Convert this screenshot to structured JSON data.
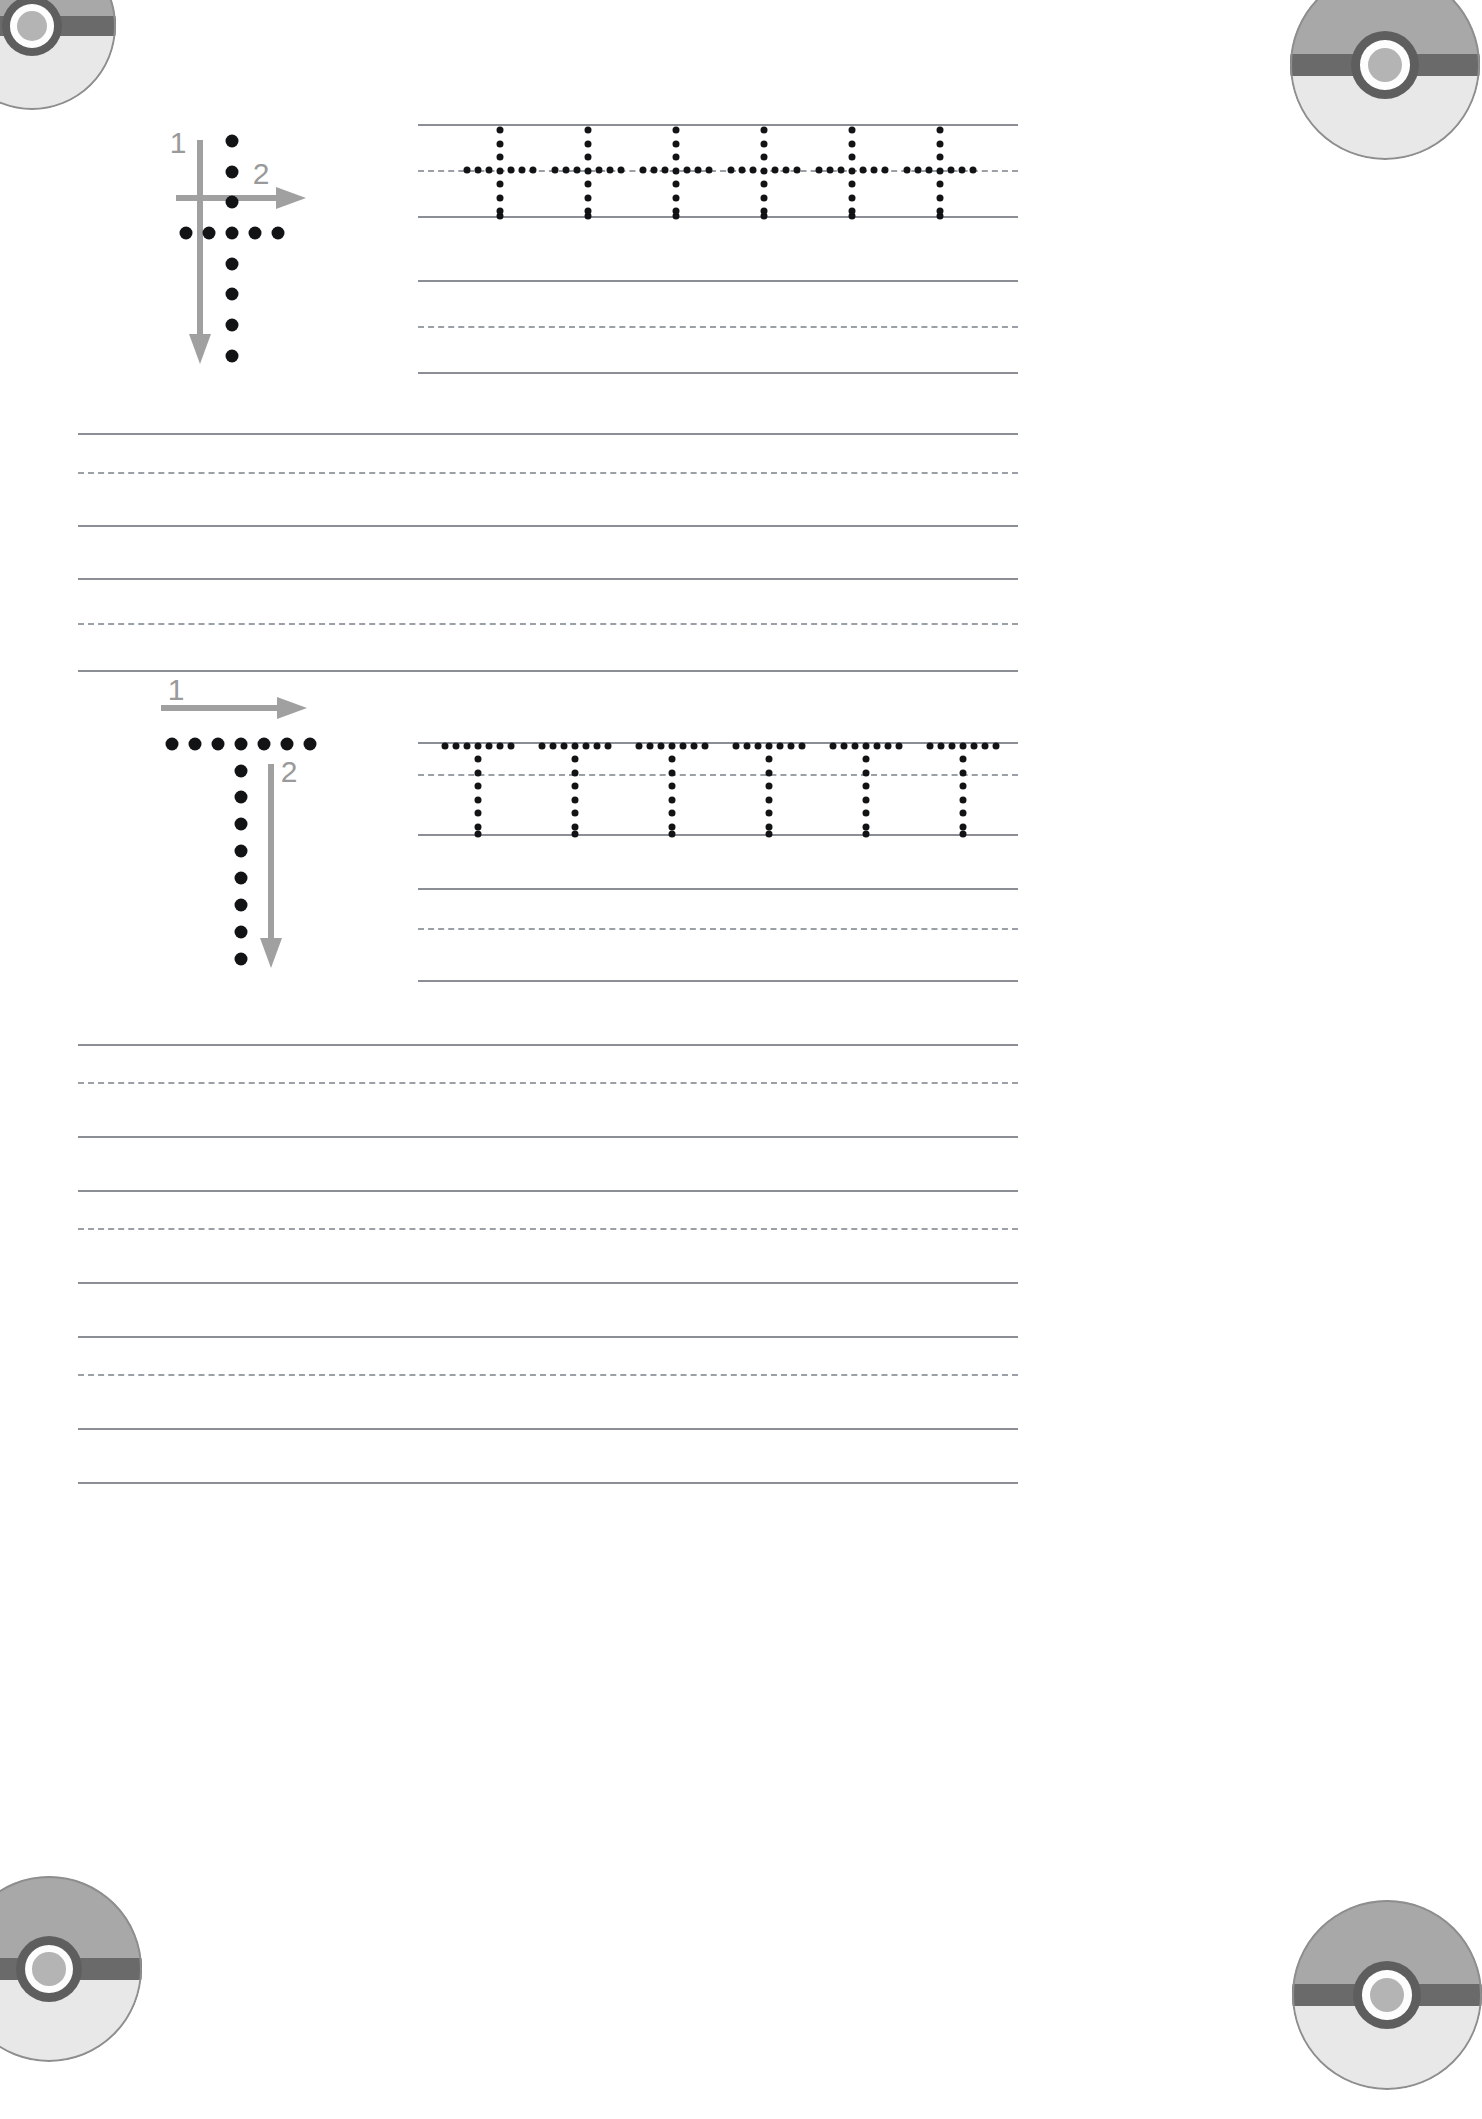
{
  "worksheet": {
    "letter_lowercase": "t",
    "letter_uppercase": "T",
    "page_width": 1482,
    "page_height": 2119,
    "colors": {
      "solid_line": "#8b8f95",
      "dashed_line": "#9aa0a6",
      "trace_dot": "#111315",
      "arrow": "#a0a0a0",
      "stroke_number": "#9a9a9a",
      "pokeball_top": "#a8a8a8",
      "pokeball_bottom": "#e8e8e8",
      "pokeball_band": "#6a6a6a",
      "pokeball_button": "#b4b4b4"
    }
  },
  "decorations": {
    "pokeballs": [
      {
        "name": "pokeball-top-left",
        "x": -52,
        "y": -58,
        "size": 168
      },
      {
        "name": "pokeball-top-right",
        "x": 1290,
        "y": -30,
        "size": 190
      },
      {
        "name": "pokeball-bottom-left",
        "x": -44,
        "y": 1876,
        "size": 186
      },
      {
        "name": "pokeball-bottom-right",
        "x": 1292,
        "y": 1900,
        "size": 190
      }
    ]
  },
  "sections": [
    {
      "id": "lowercase-t",
      "title": "Lowercase t stroke guide and trace row",
      "guide": {
        "letter": "t",
        "stroke_numbers": [
          "1",
          "2"
        ],
        "strokes": [
          {
            "number": "1",
            "direction": "down",
            "label_x": 178,
            "label_y": 143
          },
          {
            "number": "2",
            "direction": "right",
            "label_x": 259,
            "label_y": 174
          }
        ]
      },
      "trace": {
        "letter": "t",
        "count": 6
      }
    },
    {
      "id": "uppercase-T",
      "title": "Uppercase T stroke guide and trace row",
      "guide": {
        "letter": "T",
        "stroke_numbers": [
          "1",
          "2"
        ],
        "strokes": [
          {
            "number": "1",
            "direction": "right",
            "label_x": 176,
            "label_y": 690
          },
          {
            "number": "2",
            "direction": "down",
            "label_x": 288,
            "label_y": 771
          }
        ]
      },
      "trace": {
        "letter": "T",
        "count": 6
      }
    }
  ],
  "practice_rows": {
    "description": "Blank ruled four-line handwriting practice rows",
    "line_types": [
      "solid",
      "dashed",
      "solid"
    ],
    "count": 9
  }
}
